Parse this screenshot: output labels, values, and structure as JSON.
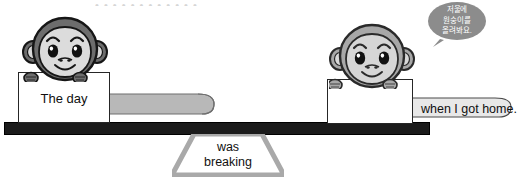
{
  "scene": {
    "type": "seesaw-balance-sentence-activity",
    "top_cutoff_text": "• • • • • • • • • • • •"
  },
  "left_side": {
    "sign_text": "The day",
    "monkey": {
      "name": "monkey-dark",
      "fur_color": "#6d6d6d",
      "face_color": "#d9d9d9"
    },
    "tail_color": "#b8b8b8"
  },
  "right_side": {
    "sign_text": "",
    "tail_text": "when I got home.",
    "monkey": {
      "name": "monkey-light",
      "fur_color": "#a8a8a8",
      "face_color": "#cfcfcf"
    },
    "tail_color": "#e4e4e4"
  },
  "fulcrum": {
    "line1": "was",
    "line2": "breaking",
    "color": "#a9a9a9"
  },
  "speech_bubble": {
    "line1": "저울에",
    "line2": "원숭이를",
    "line3": "올려봐요.",
    "color": "#8c8c8c"
  },
  "plank": {
    "color": "#1b1b1b"
  }
}
